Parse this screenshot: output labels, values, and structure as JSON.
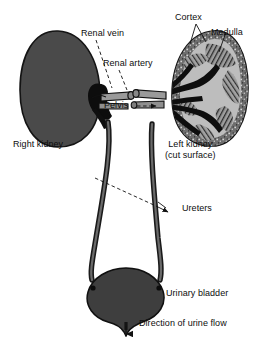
{
  "figure": {
    "background_color": "#ffffff",
    "text_color": "#0d0d0d",
    "organ_fill": "#4a4a4a",
    "organ_outline": "#111111",
    "vessel_fill": "#8d8d8d",
    "pelvis_fill": "#101010",
    "medulla_fill": "#9a9a9a"
  },
  "labels": {
    "renal_vein": "Renal vein",
    "renal_artery": "Renal artery",
    "pelvis": "Pelvis",
    "cortex": "Cortex",
    "medulla": "Medulla",
    "right_kidney": "Right kidney",
    "left_kidney_line1": "Left kidney",
    "left_kidney_line2": "(cut surface)",
    "ureters": "Ureters",
    "urinary_bladder": "Urinary bladder",
    "urine_flow": "Direction of urine flow"
  },
  "structures": [
    {
      "name": "right-kidney",
      "side": "right",
      "appearance": "solid shaded bean"
    },
    {
      "name": "left-kidney",
      "side": "left",
      "appearance": "cut surface showing cortex, medulla, pelvis"
    },
    {
      "name": "renal-vein",
      "appearance": "pale tubular vessel at hilum"
    },
    {
      "name": "renal-artery",
      "appearance": "pale tubular vessel at hilum"
    },
    {
      "name": "renal-pelvis",
      "appearance": "dark branching funnel"
    },
    {
      "name": "ureter-left",
      "appearance": "long tube to bladder"
    },
    {
      "name": "ureter-right",
      "appearance": "long tube to bladder"
    },
    {
      "name": "urinary-bladder",
      "appearance": "rounded dark sac"
    },
    {
      "name": "urethra",
      "appearance": "narrow outlet with downward arrow"
    }
  ]
}
